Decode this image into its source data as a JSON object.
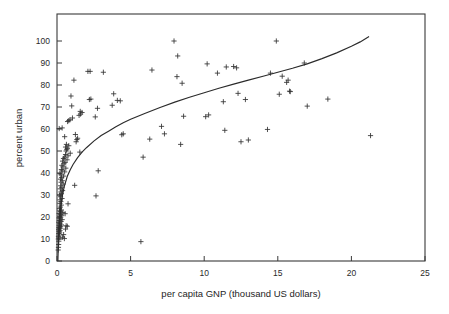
{
  "chart_data": {
    "type": "scatter",
    "title": "",
    "xlabel": "per capita GNP (thousand US dollars)",
    "ylabel": "percent urban",
    "xlim": [
      0,
      25
    ],
    "ylim": [
      0,
      100
    ],
    "xticks": [
      0,
      5,
      10,
      15,
      20,
      25
    ],
    "yticks": [
      0,
      10,
      20,
      30,
      40,
      50,
      60,
      70,
      80,
      90,
      100
    ],
    "xtick_labels": [
      "0",
      "5",
      "10",
      "15",
      "20",
      "25"
    ],
    "ytick_labels": [
      "0",
      "10",
      "20",
      "30",
      "40",
      "50",
      "60",
      "70",
      "80",
      "90",
      "100"
    ],
    "grid": false,
    "legend": null,
    "marker": "plus",
    "marker_color": "#333333",
    "curve_color": "#2b2b2b",
    "frame_color": "#3a3a3a",
    "background": "#ffffff",
    "points": [
      [
        0.08,
        5.0
      ],
      [
        0.1,
        6.2
      ],
      [
        0.11,
        7.5
      ],
      [
        0.12,
        9.0
      ],
      [
        0.09,
        10.0
      ],
      [
        0.13,
        10.5
      ],
      [
        0.1,
        11.2
      ],
      [
        0.15,
        11.8
      ],
      [
        0.12,
        12.5
      ],
      [
        0.18,
        12.8
      ],
      [
        0.14,
        13.4
      ],
      [
        0.2,
        13.8
      ],
      [
        0.11,
        14.2
      ],
      [
        0.16,
        14.6
      ],
      [
        0.22,
        14.9
      ],
      [
        0.13,
        15.2
      ],
      [
        0.19,
        15.5
      ],
      [
        0.25,
        15.8
      ],
      [
        0.15,
        16.1
      ],
      [
        0.3,
        16.4
      ],
      [
        0.17,
        16.8
      ],
      [
        0.21,
        17.2
      ],
      [
        0.12,
        17.6
      ],
      [
        0.28,
        18.0
      ],
      [
        0.16,
        18.4
      ],
      [
        0.35,
        18.8
      ],
      [
        0.2,
        19.2
      ],
      [
        0.14,
        19.6
      ],
      [
        0.26,
        20.0
      ],
      [
        0.18,
        20.4
      ],
      [
        0.32,
        20.8
      ],
      [
        0.22,
        21.2
      ],
      [
        0.15,
        21.6
      ],
      [
        0.4,
        22.0
      ],
      [
        0.24,
        22.4
      ],
      [
        0.19,
        22.8
      ],
      [
        0.3,
        23.2
      ],
      [
        0.17,
        23.8
      ],
      [
        0.55,
        21.5
      ],
      [
        0.62,
        16.0
      ],
      [
        0.7,
        15.8
      ],
      [
        0.45,
        12.0
      ],
      [
        0.5,
        10.2
      ],
      [
        0.38,
        10.8
      ],
      [
        0.58,
        14.5
      ],
      [
        0.23,
        24.5
      ],
      [
        0.29,
        25.4
      ],
      [
        0.2,
        26.2
      ],
      [
        0.75,
        26.0
      ],
      [
        0.26,
        27.0
      ],
      [
        0.21,
        27.8
      ],
      [
        0.34,
        28.4
      ],
      [
        0.24,
        29.2
      ],
      [
        0.18,
        30.0
      ],
      [
        0.3,
        30.6
      ],
      [
        0.27,
        31.4
      ],
      [
        0.38,
        32.0
      ],
      [
        0.22,
        32.8
      ],
      [
        0.33,
        33.5
      ],
      [
        0.25,
        34.2
      ],
      [
        1.2,
        34.4
      ],
      [
        0.42,
        35.0
      ],
      [
        0.28,
        35.8
      ],
      [
        0.36,
        36.5
      ],
      [
        0.24,
        37.2
      ],
      [
        0.31,
        38.0
      ],
      [
        0.45,
        38.6
      ],
      [
        0.27,
        39.2
      ],
      [
        0.2,
        39.8
      ],
      [
        0.52,
        40.5
      ],
      [
        0.35,
        41.0
      ],
      [
        0.3,
        41.6
      ],
      [
        0.6,
        42.2
      ],
      [
        0.4,
        42.8
      ],
      [
        0.33,
        43.5
      ],
      [
        0.48,
        44.2
      ],
      [
        0.55,
        44.8
      ],
      [
        0.38,
        45.4
      ],
      [
        0.68,
        46.0
      ],
      [
        0.44,
        46.6
      ],
      [
        0.52,
        47.2
      ],
      [
        0.75,
        47.8
      ],
      [
        0.58,
        48.4
      ],
      [
        0.9,
        49.0
      ],
      [
        1.55,
        49.5
      ],
      [
        0.62,
        50.0
      ],
      [
        0.66,
        50.6
      ],
      [
        0.7,
        51.2
      ],
      [
        0.58,
        51.8
      ],
      [
        0.8,
        52.4
      ],
      [
        0.64,
        53.0
      ],
      [
        1.3,
        54.2
      ],
      [
        1.35,
        55.2
      ],
      [
        1.4,
        55.8
      ],
      [
        0.52,
        56.5
      ],
      [
        1.25,
        57.5
      ],
      [
        4.4,
        57.4
      ],
      [
        4.5,
        57.8
      ],
      [
        0.15,
        60.2
      ],
      [
        0.35,
        60.5
      ],
      [
        0.72,
        63.4
      ],
      [
        0.8,
        63.8
      ],
      [
        0.88,
        64.2
      ],
      [
        1.05,
        65.0
      ],
      [
        2.6,
        65.5
      ],
      [
        1.5,
        66.2
      ],
      [
        1.6,
        66.8
      ],
      [
        1.7,
        67.5
      ],
      [
        1.58,
        68.0
      ],
      [
        2.75,
        69.4
      ],
      [
        1.0,
        70.5
      ],
      [
        3.75,
        70.8
      ],
      [
        0.95,
        75.0
      ],
      [
        4.3,
        72.8
      ],
      [
        2.2,
        73.4
      ],
      [
        2.3,
        73.6
      ],
      [
        4.1,
        73.0
      ],
      [
        3.85,
        76.0
      ],
      [
        1.15,
        82.2
      ],
      [
        2.1,
        86.2
      ],
      [
        2.25,
        86.2
      ],
      [
        3.15,
        85.8
      ],
      [
        2.8,
        41.0
      ],
      [
        2.65,
        29.6
      ],
      [
        5.7,
        8.8
      ],
      [
        5.85,
        47.2
      ],
      [
        6.3,
        55.4
      ],
      [
        6.45,
        86.8
      ],
      [
        7.1,
        61.2
      ],
      [
        7.3,
        57.8
      ],
      [
        7.95,
        100.0
      ],
      [
        8.15,
        83.8
      ],
      [
        8.2,
        93.2
      ],
      [
        8.5,
        80.8
      ],
      [
        8.4,
        53.0
      ],
      [
        8.6,
        65.8
      ],
      [
        10.1,
        65.6
      ],
      [
        10.3,
        66.4
      ],
      [
        10.2,
        89.6
      ],
      [
        10.9,
        85.4
      ],
      [
        11.3,
        72.4
      ],
      [
        11.4,
        59.4
      ],
      [
        11.5,
        88.2
      ],
      [
        12.0,
        88.4
      ],
      [
        12.2,
        87.8
      ],
      [
        12.3,
        76.2
      ],
      [
        12.5,
        54.2
      ],
      [
        12.8,
        73.4
      ],
      [
        13.0,
        55.0
      ],
      [
        14.3,
        59.8
      ],
      [
        14.5,
        85.4
      ],
      [
        14.9,
        100.0
      ],
      [
        15.1,
        75.8
      ],
      [
        15.3,
        84.0
      ],
      [
        15.6,
        81.2
      ],
      [
        15.7,
        82.2
      ],
      [
        15.8,
        77.2
      ],
      [
        15.85,
        77.0
      ],
      [
        16.8,
        90.0
      ],
      [
        17.0,
        70.4
      ],
      [
        18.4,
        73.6
      ],
      [
        21.3,
        57.0
      ]
    ],
    "fit": {
      "kind": "logarithmic",
      "description": "fitted curve rising steeply near origin and flattening toward the right",
      "x_start": 0.06,
      "x_end": 21.2,
      "y_start": 0.0,
      "y_end": 102.0,
      "points": [
        [
          0.06,
          0.0
        ],
        [
          0.1,
          9.0
        ],
        [
          0.15,
          16.0
        ],
        [
          0.2,
          21.0
        ],
        [
          0.3,
          27.0
        ],
        [
          0.4,
          31.0
        ],
        [
          0.5,
          34.0
        ],
        [
          0.7,
          38.5
        ],
        [
          0.9,
          41.5
        ],
        [
          1.1,
          44.0
        ],
        [
          1.4,
          47.0
        ],
        [
          1.7,
          49.5
        ],
        [
          2.0,
          51.5
        ],
        [
          2.5,
          54.5
        ],
        [
          3.0,
          57.0
        ],
        [
          3.5,
          59.0
        ],
        [
          4.0,
          61.0
        ],
        [
          4.5,
          62.8
        ],
        [
          5.0,
          64.4
        ],
        [
          6.0,
          67.2
        ],
        [
          7.0,
          69.8
        ],
        [
          8.0,
          72.2
        ],
        [
          9.0,
          74.4
        ],
        [
          10.0,
          76.5
        ],
        [
          11.0,
          78.5
        ],
        [
          12.0,
          80.4
        ],
        [
          13.0,
          82.2
        ],
        [
          14.0,
          84.0
        ],
        [
          15.0,
          85.8
        ],
        [
          16.0,
          87.6
        ],
        [
          17.0,
          89.6
        ],
        [
          18.0,
          92.0
        ],
        [
          19.0,
          94.6
        ],
        [
          20.0,
          97.6
        ],
        [
          20.6,
          99.6
        ],
        [
          21.2,
          102.0
        ]
      ]
    }
  },
  "axis": {
    "x_title": "per capita GNP (thousand US dollars)",
    "y_title": "percent urban"
  }
}
